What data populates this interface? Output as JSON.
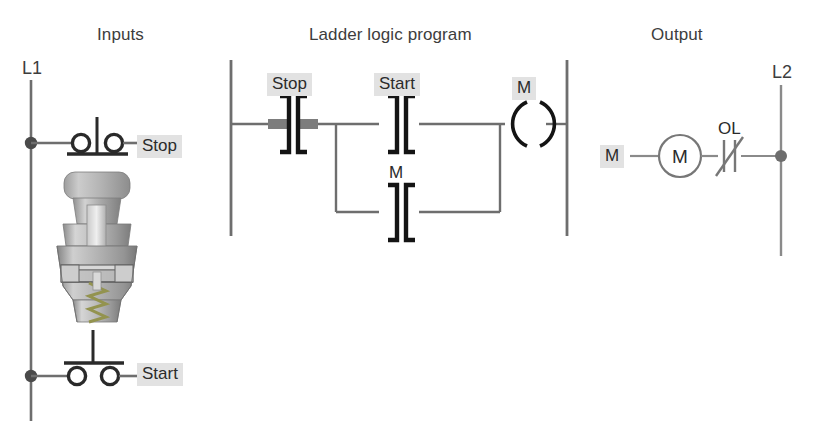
{
  "diagram": {
    "headings": {
      "inputs": "Inputs",
      "ladder": "Ladder logic program",
      "output": "Output"
    },
    "rails": {
      "left_line": "L1",
      "right_line": "L2"
    },
    "colors": {
      "wire": "#6e6e6e",
      "symbol": "#1a1a1a",
      "rail": "#7a7a7a",
      "highlight_bar": "#7d7d7d",
      "tag_background": "#e2e2e2",
      "text": "#3d3d3d",
      "illustration_light": "#d6d6d6",
      "illustration_mid": "#a9a9a9",
      "illustration_dark": "#8a8a8a",
      "spring": "#9b9b6a"
    }
  },
  "inputs": {
    "stop_pushbutton": {
      "label": "Stop",
      "symbol": "normally-closed-pushbutton",
      "state": "closed"
    },
    "start_pushbutton": {
      "label": "Start",
      "symbol": "normally-open-pushbutton",
      "state": "open"
    },
    "illustration": {
      "name": "pushbutton-cutaway-illustration",
      "description": "Cutaway view of a spring-return pushbutton switch"
    }
  },
  "ladder": {
    "rungs": [
      {
        "elements": [
          {
            "tag": "Stop",
            "type": "examine-if-closed",
            "highlighted": true,
            "energized": true,
            "labeled": true
          },
          {
            "tag": "Start",
            "type": "examine-if-closed",
            "highlighted": false,
            "energized": false,
            "labeled": true
          },
          {
            "tag": "M",
            "type": "output-coil",
            "highlighted": true,
            "energized": false,
            "labeled": true
          }
        ],
        "branch": [
          {
            "tag": "M",
            "type": "examine-if-closed",
            "highlighted": false,
            "energized": false,
            "labeled": true
          }
        ]
      }
    ]
  },
  "output": {
    "coil_tag": "M",
    "motor": {
      "label": "M",
      "symbol": "motor-circle"
    },
    "overload": {
      "label": "OL",
      "symbol": "normally-closed-overload-contact"
    }
  }
}
